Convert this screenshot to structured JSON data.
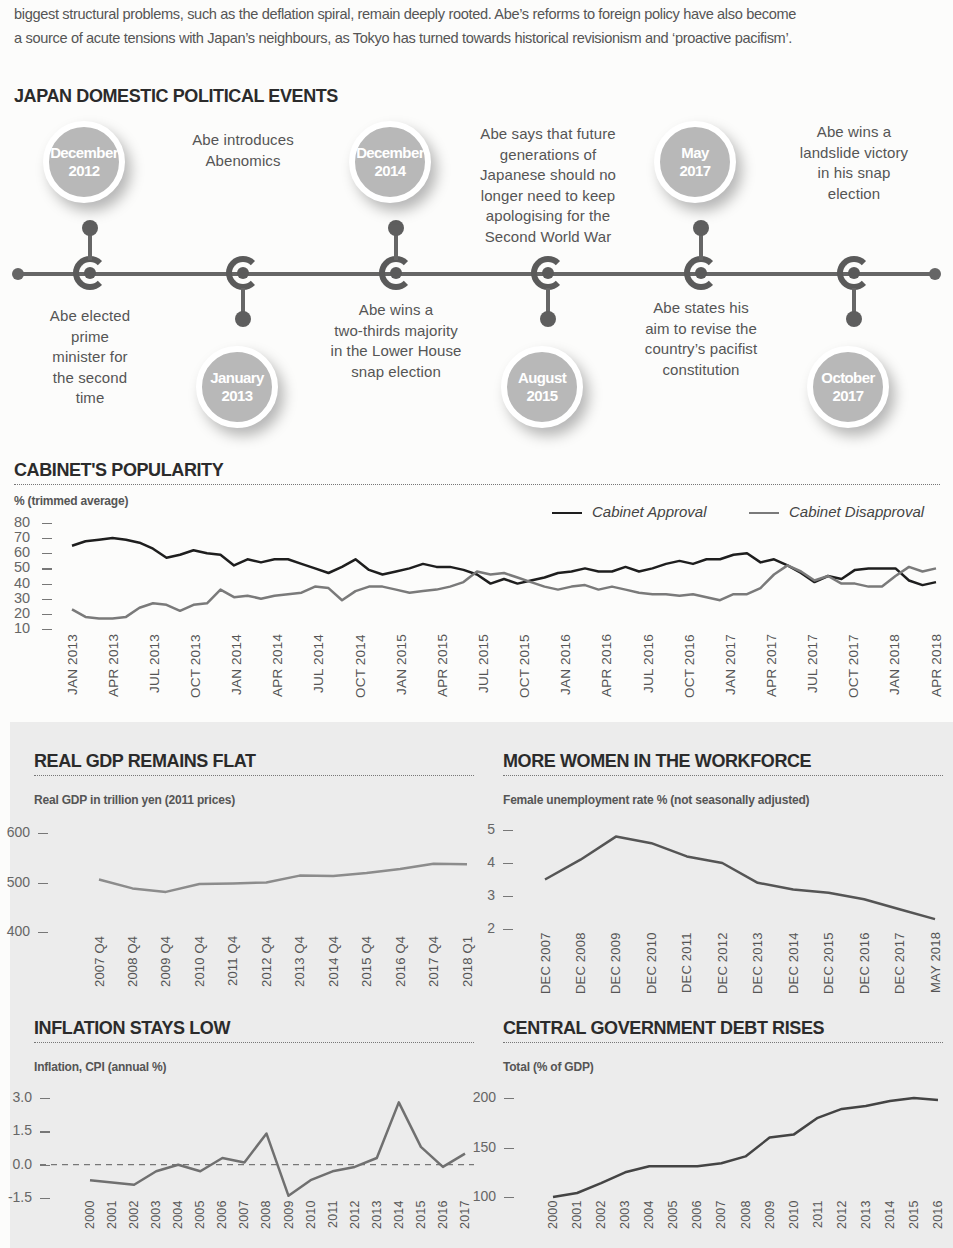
{
  "intro": {
    "line1": "biggest structural problems, such as the deflation spiral, remain deeply rooted. Abe’s reforms to foreign policy have also become",
    "line2": "a source of acute tensions with Japan’s neighbours, as Tokyo has turned towards historical revisionism and ‘proactive pacifism’."
  },
  "timeline": {
    "title": "JAPAN DOMESTIC POLITICAL EVENTS",
    "events": [
      {
        "month": "December",
        "year": "2012",
        "position": "above",
        "text_lines": [
          "Abe elected",
          "prime",
          "minister for",
          "the second",
          "time"
        ]
      },
      {
        "month": "January",
        "year": "2013",
        "position": "below",
        "text_lines": [
          "Abe introduces",
          "Abenomics"
        ]
      },
      {
        "month": "December",
        "year": "2014",
        "position": "above",
        "text_lines": [
          "Abe wins a",
          "two-thirds majority",
          "in the Lower House",
          "snap election"
        ]
      },
      {
        "month": "August",
        "year": "2015",
        "position": "below",
        "text_lines": [
          "Abe says that future",
          "generations of",
          "Japanese should no",
          "longer need to keep",
          "apologising for the",
          "Second World War"
        ]
      },
      {
        "month": "May",
        "year": "2017",
        "position": "above",
        "text_lines": [
          "Abe states his",
          "aim to revise the",
          "country’s pacifist",
          "constitution"
        ]
      },
      {
        "month": "October",
        "year": "2017",
        "position": "below",
        "text_lines": [
          "Abe wins a",
          "landslide victory",
          "in his snap",
          "election"
        ]
      }
    ]
  },
  "chart_data": [
    {
      "id": "cabinet",
      "type": "line",
      "title": "CABINET'S POPULARITY",
      "ylabel": "% (trimmed average)",
      "xlabel": "",
      "ylim": [
        10,
        80
      ],
      "yticks": [
        "80",
        "70",
        "60",
        "50",
        "40",
        "30",
        "20",
        "10"
      ],
      "grid": false,
      "legend_position": "top-right",
      "categories": [
        "JAN 2013",
        "APR 2013",
        "JUL 2013",
        "OCT 2013",
        "JAN 2014",
        "APR 2014",
        "JUL 2014",
        "OCT 2014",
        "JAN 2015",
        "APR 2015",
        "JUL 2015",
        "OCT 2015",
        "JAN 2016",
        "APR 2016",
        "JUL 2016",
        "OCT 2016",
        "JAN 2017",
        "APR 2017",
        "JUL 2017",
        "OCT 2017",
        "JAN 2018",
        "APR 2018"
      ],
      "series": [
        {
          "name": "Cabinet Approval",
          "color": "#1e1e1e",
          "values": [
            65,
            68,
            69,
            70,
            69,
            67,
            63,
            57,
            59,
            62,
            60,
            59,
            52,
            56,
            54,
            56,
            56,
            53,
            50,
            47,
            51,
            56,
            49,
            46,
            48,
            50,
            53,
            51,
            51,
            49,
            46,
            40,
            43,
            40,
            42,
            44,
            47,
            48,
            50,
            48,
            48,
            51,
            48,
            50,
            53,
            55,
            53,
            56,
            56,
            59,
            60,
            54,
            56,
            52,
            47,
            41,
            45,
            43,
            49,
            50,
            50,
            50,
            42,
            39,
            41
          ]
        },
        {
          "name": "Cabinet Disapproval",
          "color": "#7a7a7a",
          "values": [
            23,
            18,
            17,
            17,
            18,
            24,
            27,
            26,
            22,
            26,
            27,
            36,
            31,
            32,
            30,
            32,
            33,
            34,
            38,
            37,
            29,
            35,
            38,
            38,
            36,
            34,
            35,
            36,
            38,
            41,
            48,
            46,
            47,
            44,
            41,
            38,
            36,
            38,
            39,
            36,
            38,
            36,
            34,
            33,
            33,
            32,
            33,
            31,
            29,
            33,
            33,
            37,
            46,
            52,
            48,
            42,
            45,
            40,
            40,
            38,
            38,
            45,
            51,
            48,
            50
          ]
        }
      ]
    },
    {
      "id": "gdp",
      "type": "line",
      "title": "REAL GDP REMAINS FLAT",
      "ylabel": "Real GDP in trillion yen (2011 prices)",
      "ylim": [
        400,
        600
      ],
      "yticks": [
        "600",
        "500",
        "400"
      ],
      "categories": [
        "2007 Q4",
        "2008 Q4",
        "2009 Q4",
        "2010 Q4",
        "2011 Q4",
        "2012 Q4",
        "2013 Q4",
        "2014 Q4",
        "2015 Q4",
        "2016 Q4",
        "2017 Q4",
        "2018 Q1"
      ],
      "series": [
        {
          "name": "Real GDP",
          "color": "#8c8c8c",
          "values": [
            506,
            488,
            481,
            497,
            498,
            500,
            514,
            513,
            519,
            527,
            538,
            537
          ]
        }
      ]
    },
    {
      "id": "women",
      "type": "line",
      "title": "MORE WOMEN IN THE WORKFORCE",
      "ylabel": "Female unemployment rate % (not seasonally adjusted)",
      "ylim": [
        2,
        5
      ],
      "yticks": [
        "5",
        "4",
        "3",
        "2"
      ],
      "categories": [
        "DEC 2007",
        "DEC 2008",
        "DEC 2009",
        "DEC 2010",
        "DEC 2011",
        "DEC 2012",
        "DEC 2013",
        "DEC 2014",
        "DEC 2015",
        "DEC 2016",
        "DEC 2017",
        "MAY 2018"
      ],
      "series": [
        {
          "name": "Female unemployment rate",
          "color": "#555555",
          "values": [
            3.5,
            4.1,
            4.8,
            4.6,
            4.2,
            4.0,
            3.4,
            3.2,
            3.1,
            2.9,
            2.6,
            2.3
          ]
        }
      ]
    },
    {
      "id": "inflation",
      "type": "line",
      "title": "INFLATION STAYS LOW",
      "ylabel": "Inflation, CPI (annual %)",
      "ylim": [
        -1.5,
        3.0
      ],
      "yticks": [
        "3.0",
        "1.5",
        "0.0",
        "-1.5"
      ],
      "reference_line": 0.0,
      "categories": [
        "2000",
        "2001",
        "2002",
        "2003",
        "2004",
        "2005",
        "2006",
        "2007",
        "2008",
        "2009",
        "2010",
        "2011",
        "2012",
        "2013",
        "2014",
        "2015",
        "2016",
        "2017"
      ],
      "series": [
        {
          "name": "CPI inflation",
          "color": "#707070",
          "values": [
            -0.7,
            -0.8,
            -0.9,
            -0.3,
            0.0,
            -0.3,
            0.3,
            0.1,
            1.4,
            -1.4,
            -0.7,
            -0.3,
            -0.1,
            0.3,
            2.8,
            0.8,
            -0.1,
            0.5
          ]
        }
      ]
    },
    {
      "id": "debt",
      "type": "line",
      "title": "CENTRAL GOVERNMENT DEBT RISES",
      "ylabel": "Total (% of GDP)",
      "ylim": [
        100,
        200
      ],
      "yticks": [
        "200",
        "150",
        "100"
      ],
      "categories": [
        "2000",
        "2001",
        "2002",
        "2003",
        "2004",
        "2005",
        "2006",
        "2007",
        "2008",
        "2009",
        "2010",
        "2011",
        "2012",
        "2013",
        "2014",
        "2015",
        "2016"
      ],
      "series": [
        {
          "name": "Central government debt",
          "color": "#444444",
          "values": [
            100,
            104,
            114,
            125,
            131,
            131,
            131,
            134,
            141,
            160,
            163,
            180,
            189,
            192,
            197,
            200,
            198
          ]
        }
      ]
    }
  ]
}
